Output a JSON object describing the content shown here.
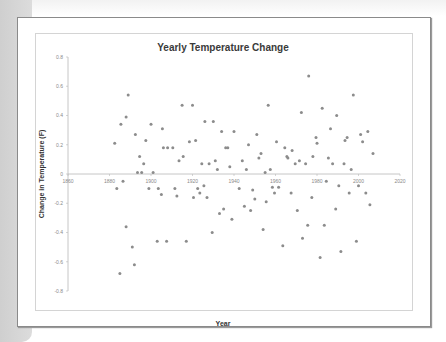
{
  "chart_data": {
    "type": "scatter",
    "title": "Yearly Temperature Change",
    "xlabel": "Year",
    "ylabel": "Change in Temperature (F)",
    "xlim": [
      1860,
      2020
    ],
    "ylim": [
      -0.8,
      0.8
    ],
    "x_ticks": [
      1860,
      1880,
      1900,
      1920,
      1940,
      1960,
      1980,
      2000,
      2020
    ],
    "y_ticks": [
      0.8,
      0.6,
      0.4,
      0.2,
      0,
      -0.2,
      -0.4,
      -0.6,
      -0.8
    ],
    "y_tick_labels": [
      "0.8",
      "0.6",
      "0.4",
      "0.2",
      "0",
      "-0.2",
      "-0.4",
      "-0.6",
      "-0.8"
    ],
    "grid": false,
    "legend": "none",
    "marker_color": "#8c8c8c",
    "series": [
      {
        "name": "Temperature change",
        "points": [
          [
            1882.5,
            0.21
          ],
          [
            1883.5,
            -0.1
          ],
          [
            1885,
            -0.68
          ],
          [
            1885.5,
            0.34
          ],
          [
            1886.5,
            -0.05
          ],
          [
            1888,
            0.39
          ],
          [
            1888,
            -0.36
          ],
          [
            1889,
            0.54
          ],
          [
            1891,
            -0.5
          ],
          [
            1892,
            -0.62
          ],
          [
            1892.5,
            0.27
          ],
          [
            1893.5,
            0.01
          ],
          [
            1894.5,
            0.12
          ],
          [
            1895.5,
            0.01
          ],
          [
            1896.5,
            0.07
          ],
          [
            1897.5,
            0.23
          ],
          [
            1899,
            -0.1
          ],
          [
            1900,
            0.34
          ],
          [
            1901,
            0.01
          ],
          [
            1903,
            -0.46
          ],
          [
            1903.5,
            -0.1
          ],
          [
            1905,
            -0.14
          ],
          [
            1905.5,
            0.31
          ],
          [
            1906,
            0.18
          ],
          [
            1907.5,
            -0.46
          ],
          [
            1908,
            0.18
          ],
          [
            1910.5,
            0.18
          ],
          [
            1911.5,
            -0.1
          ],
          [
            1912.5,
            -0.15
          ],
          [
            1913.5,
            0.09
          ],
          [
            1915,
            0.47
          ],
          [
            1915.5,
            0.12
          ],
          [
            1917,
            -0.46
          ],
          [
            1918.5,
            0.22
          ],
          [
            1920,
            0.47
          ],
          [
            1920.5,
            -0.16
          ],
          [
            1921.5,
            0.23
          ],
          [
            1922.5,
            -0.1
          ],
          [
            1923.5,
            -0.13
          ],
          [
            1924.5,
            0.07
          ],
          [
            1925.5,
            -0.08
          ],
          [
            1926,
            0.36
          ],
          [
            1927,
            -0.16
          ],
          [
            1928,
            0.07
          ],
          [
            1929.5,
            -0.4
          ],
          [
            1930,
            0.36
          ],
          [
            1931,
            0.09
          ],
          [
            1932,
            0.03
          ],
          [
            1933,
            -0.27
          ],
          [
            1934,
            0.29
          ],
          [
            1935,
            -0.24
          ],
          [
            1936,
            0.18
          ],
          [
            1937,
            0.18
          ],
          [
            1938,
            0.05
          ],
          [
            1939,
            -0.31
          ],
          [
            1940,
            0.29
          ],
          [
            1942.5,
            -0.1
          ],
          [
            1944,
            0.09
          ],
          [
            1945,
            -0.22
          ],
          [
            1946,
            0.03
          ],
          [
            1947,
            0.2
          ],
          [
            1948,
            -0.25
          ],
          [
            1949,
            -0.11
          ],
          [
            1950,
            -0.17
          ],
          [
            1951,
            0.27
          ],
          [
            1952,
            0.11
          ],
          [
            1953,
            0.14
          ],
          [
            1954,
            -0.38
          ],
          [
            1955,
            0.01
          ],
          [
            1955.5,
            -0.19
          ],
          [
            1956.5,
            0.47
          ],
          [
            1957.5,
            0.03
          ],
          [
            1958.5,
            -0.09
          ],
          [
            1959.5,
            -0.13
          ],
          [
            1960.5,
            0.22
          ],
          [
            1961.5,
            -0.09
          ],
          [
            1963.5,
            -0.49
          ],
          [
            1964.5,
            0.18
          ],
          [
            1965.5,
            0.12
          ],
          [
            1966,
            0.11
          ],
          [
            1967.5,
            -0.13
          ],
          [
            1968,
            0.16
          ],
          [
            1969.5,
            0.07
          ],
          [
            1970.5,
            -0.25
          ],
          [
            1971.5,
            0.09
          ],
          [
            1972.5,
            0.42
          ],
          [
            1973,
            -0.44
          ],
          [
            1974.5,
            0.07
          ],
          [
            1975.5,
            -0.35
          ],
          [
            1976,
            0.67
          ],
          [
            1977.5,
            -0.16
          ],
          [
            1978,
            0.12
          ],
          [
            1979.5,
            0.25
          ],
          [
            1980,
            0.21
          ],
          [
            1981.5,
            -0.57
          ],
          [
            1982.5,
            0.45
          ],
          [
            1983.5,
            -0.35
          ],
          [
            1984.5,
            -0.05
          ],
          [
            1985.5,
            0.11
          ],
          [
            1986.5,
            0.31
          ],
          [
            1987.5,
            0.07
          ],
          [
            1989,
            -0.24
          ],
          [
            1989.5,
            0.4
          ],
          [
            1990.5,
            -0.08
          ],
          [
            1991.5,
            -0.53
          ],
          [
            1993,
            0.07
          ],
          [
            1993.5,
            0.23
          ],
          [
            1994.5,
            0.25
          ],
          [
            1995.5,
            -0.13
          ],
          [
            1996.5,
            0.03
          ],
          [
            1997.5,
            0.54
          ],
          [
            1999,
            -0.46
          ],
          [
            2000,
            -0.08
          ],
          [
            2001,
            0.27
          ],
          [
            2002,
            0.22
          ],
          [
            2003.5,
            -0.13
          ],
          [
            2004.5,
            0.29
          ],
          [
            2005.5,
            -0.21
          ],
          [
            2007,
            0.14
          ]
        ]
      }
    ]
  }
}
